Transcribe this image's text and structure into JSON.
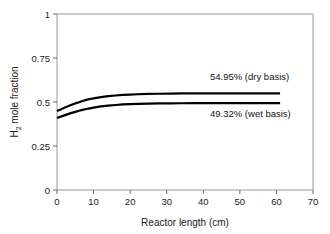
{
  "chart_data": {
    "type": "line",
    "title": "",
    "xlabel": "Reactor length (cm)",
    "ylabel": "H2 mole fraction",
    "ylabel_base": "H",
    "ylabel_sub": "2",
    "ylabel_rest": " mole fraction",
    "xlim": [
      0,
      70
    ],
    "ylim": [
      0,
      1
    ],
    "xticks": [
      0,
      10,
      20,
      30,
      40,
      50,
      60,
      70
    ],
    "xticklabels": [
      "0",
      "10",
      "20",
      "30",
      "40",
      "50",
      "60",
      "70"
    ],
    "yticks": [
      0,
      0.25,
      0.5,
      0.75,
      1
    ],
    "yticklabels": [
      "0",
      "0.25",
      "0.5",
      "0.75",
      "1"
    ],
    "grid": false,
    "legend_position": "inline-annotation",
    "series": [
      {
        "name": "dry basis",
        "annotation": "54.95% (dry basis)",
        "final_value_percent": 54.95,
        "color": "#000000",
        "x": [
          0,
          1,
          2,
          3,
          4,
          5,
          6,
          7,
          8,
          9,
          10,
          12,
          14,
          16,
          18,
          20,
          22,
          25,
          28,
          31,
          34,
          38,
          42,
          46,
          50,
          55,
          61
        ],
        "y": [
          0.449,
          0.458,
          0.467,
          0.476,
          0.484,
          0.492,
          0.499,
          0.506,
          0.512,
          0.517,
          0.521,
          0.528,
          0.533,
          0.537,
          0.54,
          0.542,
          0.544,
          0.546,
          0.547,
          0.548,
          0.549,
          0.5495,
          0.5495,
          0.5495,
          0.5495,
          0.5495,
          0.5495
        ]
      },
      {
        "name": "wet basis",
        "annotation": "49.32% (wet basis)",
        "final_value_percent": 49.32,
        "color": "#000000",
        "x": [
          0,
          1,
          2,
          3,
          4,
          5,
          6,
          7,
          8,
          9,
          10,
          12,
          14,
          16,
          18,
          20,
          22,
          25,
          28,
          31,
          34,
          38,
          42,
          46,
          50,
          55,
          61
        ],
        "y": [
          0.409,
          0.417,
          0.424,
          0.431,
          0.438,
          0.444,
          0.45,
          0.455,
          0.46,
          0.464,
          0.468,
          0.475,
          0.479,
          0.483,
          0.486,
          0.488,
          0.489,
          0.491,
          0.492,
          0.4925,
          0.493,
          0.4932,
          0.4932,
          0.4932,
          0.4932,
          0.4932,
          0.4932
        ]
      }
    ]
  },
  "annotations": {
    "dry": "54.95% (dry basis)",
    "wet": "49.32% (wet basis)"
  }
}
